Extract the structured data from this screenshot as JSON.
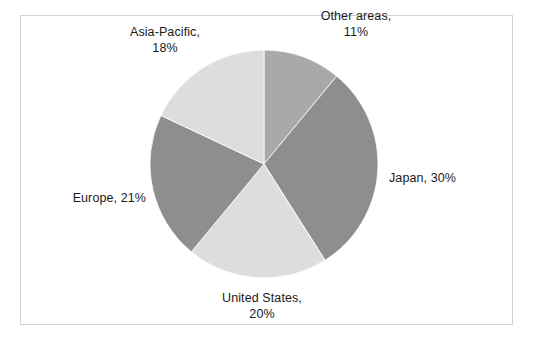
{
  "chart_data": {
    "type": "pie",
    "title": "",
    "subtitle": "",
    "xlabel": "",
    "ylabel": "",
    "legend_position": "none",
    "grid": false,
    "label_format": "{name}, {value}%",
    "start_angle_deg": 0,
    "direction": "clockwise",
    "categories": [
      "Other areas",
      "Japan",
      "United States",
      "Europe",
      "Asia-Pacific"
    ],
    "values": [
      11,
      30,
      20,
      21,
      18
    ],
    "units": "percent",
    "total": 100,
    "slices": [
      {
        "name": "Other areas",
        "value": 11,
        "value_text": "11%",
        "label_line1": "Other areas,",
        "label_line2": "11%",
        "label_single": "Other areas, 11%",
        "color": "#a9a9a9",
        "angle_deg": 39.6,
        "start_deg": 0,
        "end_deg": 39.6
      },
      {
        "name": "Japan",
        "value": 30,
        "value_text": "30%",
        "label_line1": "Japan, 30%",
        "label_line2": "",
        "label_single": "Japan, 30%",
        "color": "#8e8e8e",
        "angle_deg": 108,
        "start_deg": 39.6,
        "end_deg": 147.6
      },
      {
        "name": "United States",
        "value": 20,
        "value_text": "20%",
        "label_line1": "United States,",
        "label_line2": "20%",
        "label_single": "United States, 20%",
        "color": "#dddddd",
        "angle_deg": 72,
        "start_deg": 147.6,
        "end_deg": 219.6
      },
      {
        "name": "Europe",
        "value": 21,
        "value_text": "21%",
        "label_line1": "Europe, 21%",
        "label_line2": "",
        "label_single": "Europe, 21%",
        "color": "#8e8e8e",
        "angle_deg": 75.6,
        "start_deg": 219.6,
        "end_deg": 295.2
      },
      {
        "name": "Asia-Pacific",
        "value": 18,
        "value_text": "18%",
        "label_line1": "Asia-Pacific,",
        "label_line2": "18%",
        "label_single": "Asia-Pacific, 18%",
        "color": "#dddddd",
        "angle_deg": 64.8,
        "start_deg": 295.2,
        "end_deg": 360
      }
    ],
    "geometry": {
      "center_x": 264,
      "center_y": 164,
      "radius": 114
    },
    "frame_color": "#d2d2d2",
    "background_color": "#ffffff"
  }
}
